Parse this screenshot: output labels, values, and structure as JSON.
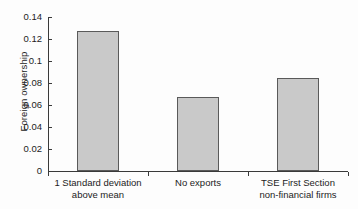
{
  "chart_data": {
    "type": "bar",
    "title": "",
    "subtitle": "",
    "xlabel": "",
    "ylabel": "Foreign ownership",
    "ylim": [
      0,
      0.14
    ],
    "yticks": [
      0,
      0.02,
      0.04,
      0.06,
      0.08,
      0.1,
      0.12,
      0.14
    ],
    "ytick_labels": [
      "0",
      "0.02",
      "0.04",
      "0.06",
      "0.08",
      "0.1",
      "0.12",
      "0.14"
    ],
    "grid": false,
    "legend": null,
    "legend_position": "none",
    "bar_fill_color": "#c9c9c9",
    "bar_edge_color": "#5a5a5a",
    "categories": [
      "1 Standard deviation above mean",
      "No exports",
      "TSE First Section non-financial firms"
    ],
    "category_lines": [
      [
        "1 Standard deviation",
        "above mean"
      ],
      [
        "No exports",
        ""
      ],
      [
        "TSE First Section",
        "non-financial firms"
      ]
    ],
    "values": [
      0.127,
      0.067,
      0.085
    ]
  }
}
